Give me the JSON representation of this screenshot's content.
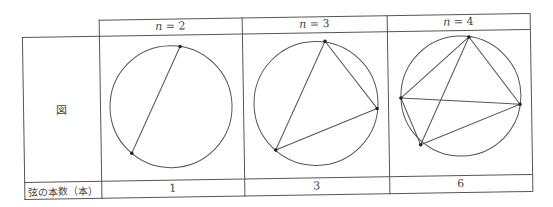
{
  "table": {
    "header": {
      "columns": [
        {
          "n_label": "n",
          "eq": " = ",
          "value": "2"
        },
        {
          "n_label": "n",
          "eq": " = ",
          "value": "3"
        },
        {
          "n_label": "n",
          "eq": " = ",
          "value": "4"
        }
      ]
    },
    "figure_row_label": "図",
    "count_row_label": "弦の本数（本）",
    "counts": [
      "1",
      "3",
      "6"
    ]
  },
  "figures": [
    {
      "n": 2,
      "points": 2,
      "chords": 1
    },
    {
      "n": 3,
      "points": 3,
      "chords": 3
    },
    {
      "n": 4,
      "points": 4,
      "chords": 6
    }
  ],
  "colors": {
    "line": "#555555",
    "text": "#444444",
    "background": "#ffffff"
  }
}
